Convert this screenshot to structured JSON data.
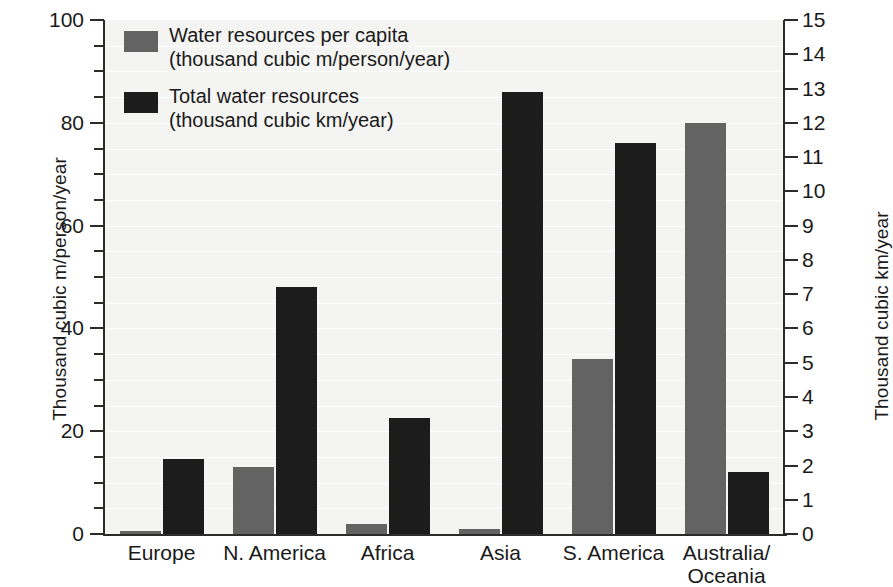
{
  "chart_data": {
    "type": "bar",
    "title": "",
    "subtitle": "",
    "categories": [
      "Europe",
      "N. America",
      "Africa",
      "Asia",
      "S. America",
      "Australia/\nOceania"
    ],
    "category_labels_display": [
      [
        "Europe"
      ],
      [
        "N. America"
      ],
      [
        "Africa"
      ],
      [
        "Asia"
      ],
      [
        "S. America"
      ],
      [
        "Australia/",
        "Oceania"
      ]
    ],
    "series": [
      {
        "name": "Water resources per capita",
        "unit": "(thousand cubic m/person/year)",
        "axis": "left",
        "color": "#636363",
        "values": [
          0.5,
          13,
          2,
          1,
          34,
          80
        ]
      },
      {
        "name": "Total water resources",
        "unit": "(thousand cubic km/year)",
        "axis": "right",
        "color": "#1c1c1c",
        "values": [
          2.2,
          7.2,
          3.4,
          12.9,
          11.4,
          1.8
        ]
      }
    ],
    "left_axis": {
      "label": "Thousand cubic m/person/year",
      "min": 0,
      "max": 100,
      "major_ticks": [
        0,
        20,
        40,
        60,
        80,
        100
      ],
      "minor_ticks": [
        5,
        10,
        15,
        25,
        30,
        35,
        45,
        50,
        55,
        65,
        70,
        75,
        85,
        90,
        95
      ],
      "tick_labels": [
        "0",
        "20",
        "40",
        "60",
        "80",
        "100"
      ]
    },
    "right_axis": {
      "label": "Thousand cubic km/year",
      "min": 0,
      "max": 15,
      "major_ticks": [
        0,
        1,
        2,
        3,
        4,
        5,
        6,
        7,
        8,
        9,
        10,
        11,
        12,
        13,
        14,
        15
      ],
      "tick_labels": [
        "0",
        "1",
        "2",
        "3",
        "4",
        "5",
        "6",
        "7",
        "8",
        "9",
        "10",
        "11",
        "12",
        "13",
        "14",
        "15"
      ]
    },
    "grid": {
      "visible": true,
      "orientation": "horizontal",
      "color": "#ffffff"
    },
    "legend": {
      "position": "top-left",
      "entries": [
        {
          "line1": "Water resources per capita",
          "line2": "(thousand cubic m/person/year)",
          "swatch": "grey"
        },
        {
          "line1": "Total water resources",
          "line2": "(thousand cubic km/year)",
          "swatch": "black"
        }
      ]
    },
    "colors": {
      "series_grey": "#636363",
      "series_black": "#1c1c1c",
      "plot_background": "#f4f4f2",
      "gridline": "#ffffff",
      "axis": "#2b2b2b",
      "text": "#1a1a1a"
    }
  }
}
